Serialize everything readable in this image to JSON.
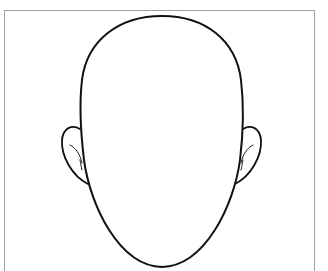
{
  "illustration": {
    "subject": "blank face outline",
    "parts": [
      "head-outline",
      "left-ear",
      "right-ear"
    ],
    "colors": {
      "background": "#ffffff",
      "frame": "#a0a0a0",
      "stroke": "#111111"
    }
  }
}
